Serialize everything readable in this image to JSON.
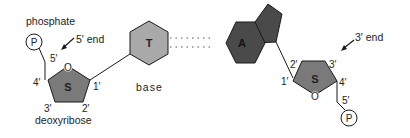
{
  "diagram": {
    "type": "nucleotide base pair schematic",
    "left_nucleotide": {
      "phosphate_label": "phosphate",
      "phosphate_symbol": "P",
      "end_label": "5′ end",
      "sugar_symbol": "S",
      "sugar_label": "deoxyribose",
      "ring_oxygen": "O",
      "carbon_labels": {
        "c1": "1′",
        "c2": "2′",
        "c3": "3′",
        "c4": "4′",
        "c5": "5′"
      },
      "base_symbol": "T",
      "base_label": "base"
    },
    "right_nucleotide": {
      "base_symbol": "A",
      "sugar_symbol": "S",
      "ring_oxygen": "O",
      "phosphate_symbol": "P",
      "end_label": "3′ end",
      "carbon_labels": {
        "c1": "1′",
        "c2": "2′",
        "c3": "3′",
        "c4": "4′",
        "c5": "5′"
      }
    },
    "hydrogen_bond_count": 2,
    "colors": {
      "sugar_fill": "#7a7a7a",
      "thymine_fill": "#a9a9a9",
      "adenine_fill": "#4a4a4a",
      "stroke": "#1a1a1a",
      "text": "#222222"
    }
  }
}
